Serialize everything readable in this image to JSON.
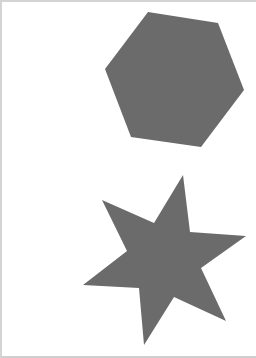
{
  "canvas": {
    "width": 256,
    "height": 358,
    "background": "#ffffff",
    "border_color": "#d4d4d4"
  },
  "shapes": [
    {
      "name": "hexagon",
      "fill": "#6b6b6b",
      "points": "148,12 218,23 244,90 201,147 131,137 105,69"
    },
    {
      "name": "six-point-star",
      "fill": "#6b6b6b",
      "points": "183,175 190,232 246,236 201,268 226,321 174,297 144,345 139,288 83,285 127,251 102,200 154,223"
    }
  ]
}
